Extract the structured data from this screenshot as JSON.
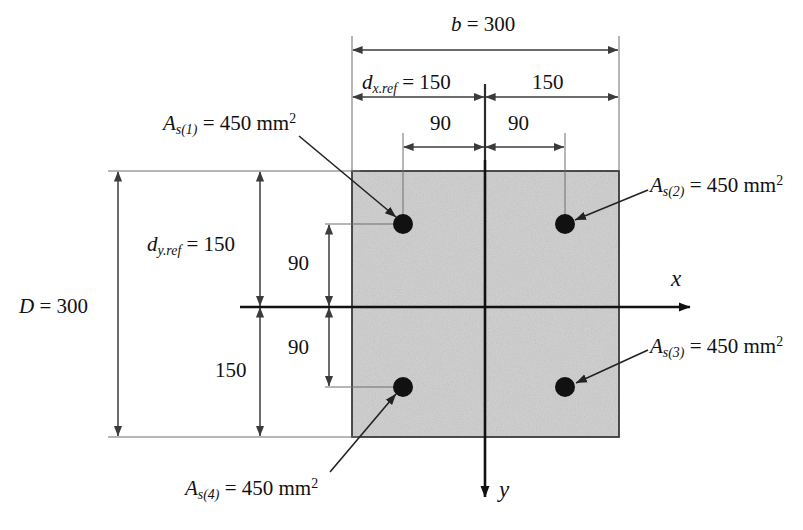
{
  "figure": {
    "type": "engineering-cross-section-diagram",
    "colors": {
      "section_fill": "#d2d2d2",
      "outline": "#3a3a3a",
      "dimension_line": "#3b3b3b",
      "axis_line": "#111111",
      "rebar": "#111111",
      "text": "#111111"
    }
  },
  "section": {
    "width_label": "b = 300",
    "width_symbol": "b",
    "width_value": "300",
    "depth_label": "D = 300",
    "depth_symbol": "D",
    "depth_value": "300"
  },
  "dimensions": {
    "dx_ref": {
      "symbol": "d",
      "subscript": "x.ref",
      "value": "150"
    },
    "dx_right": {
      "value": "150"
    },
    "dy_ref": {
      "symbol": "d",
      "subscript": "y.ref",
      "value": "150"
    },
    "dy_bottom": {
      "value": "150"
    },
    "bar_offset_left": "90",
    "bar_offset_right": "90",
    "bar_offset_top": "90",
    "bar_offset_bottom": "90"
  },
  "axes": {
    "x_label": "x",
    "y_label": "y"
  },
  "rebars": [
    {
      "id": "As1",
      "label_symbol": "A",
      "label_sub": "s(1)",
      "label_value": "450",
      "label_unit": "mm",
      "label_exp": "2",
      "position": "top-left"
    },
    {
      "id": "As2",
      "label_symbol": "A",
      "label_sub": "s(2)",
      "label_value": "450",
      "label_unit": "mm",
      "label_exp": "2",
      "position": "top-right"
    },
    {
      "id": "As3",
      "label_symbol": "A",
      "label_sub": "s(3)",
      "label_value": "450",
      "label_unit": "mm",
      "label_exp": "2",
      "position": "bottom-right"
    },
    {
      "id": "As4",
      "label_symbol": "A",
      "label_sub": "s(4)",
      "label_value": "450",
      "label_unit": "mm",
      "label_exp": "2",
      "position": "bottom-left"
    }
  ],
  "text_parts": {
    "eq": " = ",
    "as1_sub": "s(1)",
    "as2_sub": "s(2)",
    "as3_sub": "s(3)",
    "as4_sub": "s(4)",
    "area_value": "450",
    "unit_mm": " mm",
    "exp_two": "2",
    "A": "A",
    "d": "d",
    "dx_sub": "x.ref",
    "dy_sub": "y.ref",
    "val150": "150",
    "val90": "90",
    "val300": "300",
    "b": "b",
    "D": "D"
  }
}
